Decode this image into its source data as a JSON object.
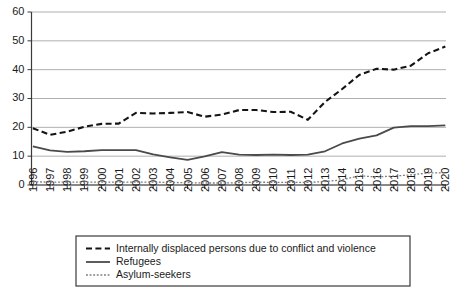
{
  "chart_data": {
    "type": "line",
    "title": "",
    "subtitle": "",
    "xlabel": "",
    "ylabel": "",
    "ylim": [
      0,
      60
    ],
    "yticks": [
      0,
      10,
      20,
      30,
      40,
      50,
      60
    ],
    "grid": true,
    "legend_position": "bottom",
    "x": [
      1996,
      1997,
      1998,
      1999,
      2000,
      2001,
      2002,
      2003,
      2004,
      2005,
      2006,
      2007,
      2008,
      2009,
      2010,
      2011,
      2012,
      2013,
      2014,
      2015,
      2016,
      2017,
      2018,
      2019,
      2020
    ],
    "categories": [
      "1996",
      "1997",
      "1998",
      "1999",
      "2000",
      "2001",
      "2002",
      "2003",
      "2004",
      "2005",
      "2006",
      "2007",
      "2008",
      "2009",
      "2010",
      "2011",
      "2012",
      "2013",
      "2014",
      "2015",
      "2016",
      "2017",
      "2018",
      "2019",
      "2020"
    ],
    "series": [
      {
        "name": "Internally displaced persons due to conflict and violence",
        "style": "dashed",
        "color": "#141414",
        "values": [
          19.7,
          17.4,
          18.5,
          20.2,
          21.2,
          21.3,
          25.0,
          24.8,
          25.0,
          25.3,
          23.7,
          24.4,
          26.0,
          26.0,
          25.3,
          25.4,
          22.6,
          28.8,
          33.3,
          38.2,
          40.3,
          40.0,
          41.4,
          45.7,
          48.0
        ]
      },
      {
        "name": "Refugees",
        "style": "solid",
        "color": "#4a4a4a",
        "values": [
          13.4,
          12.0,
          11.5,
          11.7,
          12.1,
          12.1,
          12.1,
          10.6,
          9.6,
          8.7,
          9.9,
          11.4,
          10.5,
          10.4,
          10.5,
          10.4,
          10.5,
          11.7,
          14.4,
          16.1,
          17.2,
          19.9,
          20.4,
          20.4,
          20.7
        ]
      },
      {
        "name": "Asylum-seekers",
        "style": "dotted",
        "color": "#7d7d7d",
        "values": [
          1.1,
          1.0,
          1.0,
          1.0,
          1.0,
          1.0,
          1.0,
          1.0,
          0.9,
          0.8,
          0.7,
          0.7,
          0.8,
          1.0,
          0.9,
          0.9,
          0.9,
          1.2,
          1.8,
          3.2,
          2.8,
          3.1,
          3.5,
          4.2,
          4.2
        ]
      }
    ],
    "legend": [
      {
        "label": "Internally displaced persons due to conflict and violence",
        "style": "dashed"
      },
      {
        "label": "Refugees",
        "style": "solid"
      },
      {
        "label": "Asylum-seekers",
        "style": "dotted"
      }
    ]
  }
}
